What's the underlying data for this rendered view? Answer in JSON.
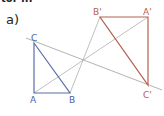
{
  "header": {
    "cut_text": "tor ..."
  },
  "part_label": "a)",
  "colors": {
    "original": "#5a6fa8",
    "image": "#b5624f",
    "construction": "#a0a0a0",
    "label_original": "#4a63a8",
    "label_image": "#b5624f"
  },
  "triangle_original": {
    "points": {
      "A": [
        34,
        93
      ],
      "B": [
        70,
        93
      ],
      "C": [
        34,
        43
      ]
    },
    "labels": {
      "A": "A",
      "B": "B",
      "C": "C"
    }
  },
  "triangle_image": {
    "points": {
      "A": [
        148,
        17
      ],
      "B": [
        100,
        17
      ],
      "C": [
        148,
        85
      ]
    },
    "labels": {
      "A": "A'",
      "B": "B'",
      "C": "C'"
    }
  },
  "center": [
    83,
    60
  ]
}
